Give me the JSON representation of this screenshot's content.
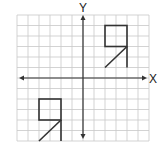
{
  "diagram": {
    "type": "coordinate-grid-transformation",
    "grid": {
      "columns": 12,
      "rows": 12,
      "x_range": [
        -6,
        6
      ],
      "y_range": [
        -6,
        6
      ],
      "line_color": "#c8c8c8",
      "axis_color": "#333333"
    },
    "axes": {
      "x_label": "X",
      "y_label": "Y"
    },
    "figures": [
      {
        "name": "upper-right-figure",
        "quadrant": "I",
        "square": {
          "x1": 2,
          "y1": 3,
          "x2": 4,
          "y2": 5
        },
        "vertical_line": {
          "from": [
            4,
            3
          ],
          "to": [
            4,
            1
          ]
        },
        "diagonal_line": {
          "from": [
            4,
            3
          ],
          "to": [
            2,
            1
          ]
        }
      },
      {
        "name": "lower-left-figure",
        "quadrant": "III",
        "square": {
          "x1": -4,
          "y1": -4,
          "x2": -2,
          "y2": -2
        },
        "vertical_line": {
          "from": [
            -2,
            -4
          ],
          "to": [
            -2,
            -6
          ]
        },
        "diagonal_line": {
          "from": [
            -2,
            -4
          ],
          "to": [
            -4,
            -6
          ]
        }
      }
    ],
    "stroke_color": "#333333"
  }
}
